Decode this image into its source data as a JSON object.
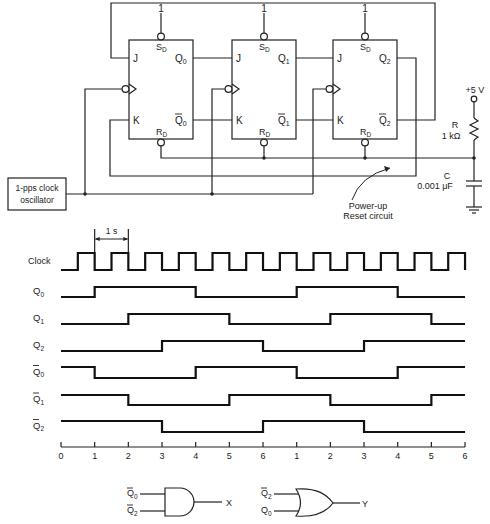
{
  "circuit": {
    "flip_flops": [
      {
        "id": "ff0",
        "x": 129,
        "inputs": {
          "j": "J",
          "k": "K",
          "sd": "S",
          "sd_sub": "D",
          "rd": "R",
          "rd_sub": "D"
        },
        "q": "Q",
        "q_sub": "0",
        "qbar": "Q",
        "qbar_sub": "0",
        "preset_value": "1"
      },
      {
        "id": "ff1",
        "x": 232,
        "inputs": {
          "j": "J",
          "k": "K",
          "sd": "S",
          "sd_sub": "D",
          "rd": "R",
          "rd_sub": "D"
        },
        "q": "Q",
        "q_sub": "1",
        "qbar": "Q",
        "qbar_sub": "1",
        "preset_value": "1"
      },
      {
        "id": "ff2",
        "x": 333,
        "inputs": {
          "j": "J",
          "k": "K",
          "sd": "S",
          "sd_sub": "D",
          "rd": "R",
          "rd_sub": "D"
        },
        "q": "Q",
        "q_sub": "2",
        "qbar": "Q",
        "qbar_sub": "2",
        "preset_value": "1"
      }
    ],
    "oscillator": {
      "line1": "1-pps clock",
      "line2": "oscillator"
    },
    "supply": {
      "label": "+5 V"
    },
    "resistor": {
      "name": "R",
      "value": "1 kΩ"
    },
    "capacitor": {
      "name": "C",
      "value": "0.001 μF"
    },
    "reset_note": {
      "line1": "Power-up",
      "line2": "Reset circuit"
    }
  },
  "timing": {
    "period_label": "1 s",
    "axis_ticks": [
      "0",
      "1",
      "2",
      "3",
      "4",
      "5",
      "6",
      "1",
      "2",
      "3",
      "4",
      "5",
      "6"
    ],
    "signals": [
      {
        "name": "Clock",
        "sub": "",
        "bar": false
      },
      {
        "name": "Q",
        "sub": "0",
        "bar": false
      },
      {
        "name": "Q",
        "sub": "1",
        "bar": false
      },
      {
        "name": "Q",
        "sub": "2",
        "bar": false
      },
      {
        "name": "Q",
        "sub": "0",
        "bar": true
      },
      {
        "name": "Q",
        "sub": "1",
        "bar": true
      },
      {
        "name": "Q",
        "sub": "2",
        "bar": true
      }
    ]
  },
  "chart_data": {
    "type": "timing",
    "title": "",
    "xlabel": "clock count",
    "x_ticks": [
      "0",
      "1",
      "2",
      "3",
      "4",
      "5",
      "6",
      "1",
      "2",
      "3",
      "4",
      "5",
      "6"
    ],
    "period": "1 s",
    "series": [
      {
        "name": "Clock",
        "transitions": "rising at t=0.5,1.5,...,11.5; falling at t=1,2,...,12",
        "initial": 0
      },
      {
        "name": "Q0",
        "segments": [
          [
            0,
            1,
            0
          ],
          [
            1,
            4,
            1
          ],
          [
            4,
            7,
            0
          ],
          [
            7,
            10,
            1
          ],
          [
            10,
            12,
            0
          ]
        ]
      },
      {
        "name": "Q1",
        "segments": [
          [
            0,
            2,
            0
          ],
          [
            2,
            5,
            1
          ],
          [
            5,
            8,
            0
          ],
          [
            8,
            11,
            1
          ],
          [
            11,
            12,
            0
          ]
        ]
      },
      {
        "name": "Q2",
        "segments": [
          [
            0,
            3,
            0
          ],
          [
            3,
            6,
            1
          ],
          [
            6,
            9,
            0
          ],
          [
            9,
            12,
            1
          ]
        ]
      },
      {
        "name": "Q0bar",
        "segments": [
          [
            0,
            1,
            1
          ],
          [
            1,
            4,
            0
          ],
          [
            4,
            7,
            1
          ],
          [
            7,
            10,
            0
          ],
          [
            10,
            12,
            1
          ]
        ]
      },
      {
        "name": "Q1bar",
        "segments": [
          [
            0,
            2,
            1
          ],
          [
            2,
            5,
            0
          ],
          [
            5,
            8,
            1
          ],
          [
            8,
            11,
            0
          ],
          [
            11,
            12,
            1
          ]
        ]
      },
      {
        "name": "Q2bar",
        "segments": [
          [
            0,
            3,
            1
          ],
          [
            3,
            6,
            0
          ],
          [
            6,
            9,
            1
          ],
          [
            9,
            12,
            0
          ]
        ]
      }
    ]
  },
  "gates": [
    {
      "type": "AND",
      "inputs": [
        {
          "name": "Q",
          "sub": "0",
          "bar": true
        },
        {
          "name": "Q",
          "sub": "2",
          "bar": true
        }
      ],
      "output": "X"
    },
    {
      "type": "OR",
      "inputs": [
        {
          "name": "Q",
          "sub": "2",
          "bar": true
        },
        {
          "name": "Q",
          "sub": "0",
          "bar": false
        }
      ],
      "output": "Y"
    }
  ]
}
